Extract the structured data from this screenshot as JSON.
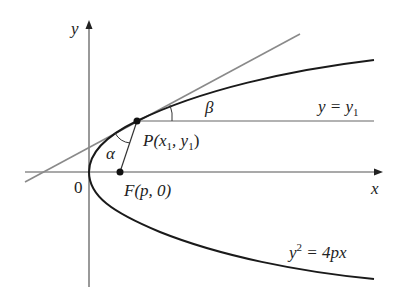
{
  "figure": {
    "axes": {
      "x_label": "x",
      "y_label": "y",
      "origin_label": "0"
    },
    "curve": {
      "equation_lhs": "y",
      "equation_exp": "2",
      "equation_rhs": " = 4px"
    },
    "point_p": {
      "label_prefix": "P(x",
      "label_sub1": "1",
      "label_mid": ", y",
      "label_sub2": "1",
      "label_suffix": ")"
    },
    "focus": {
      "label": "F(p, 0)"
    },
    "horizontal_line": {
      "label_lhs": "y = y",
      "label_sub": "1"
    },
    "angles": {
      "alpha": "α",
      "beta": "β"
    },
    "colors": {
      "curve": "#1a1a1a",
      "axes": "#555555",
      "tangent": "#8a8a8a",
      "text": "#222222"
    }
  }
}
